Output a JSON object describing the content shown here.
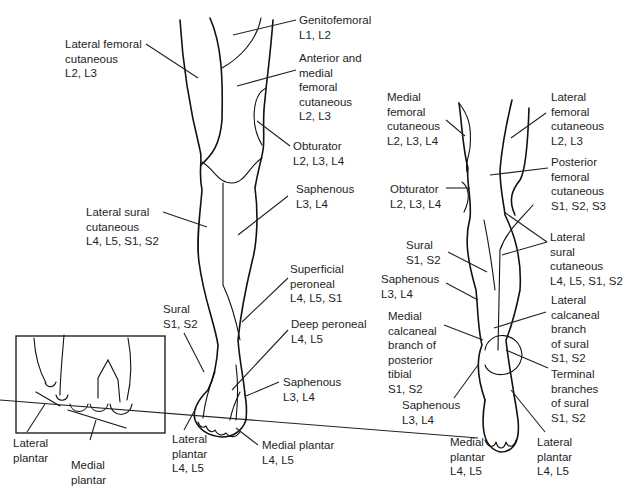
{
  "figure": {
    "panels": {
      "anterior": {
        "labels": [
          {
            "id": "genitofemoral",
            "name": "Genitofemoral",
            "roots": "L1, L2"
          },
          {
            "id": "lateral-femoral-cutaneous",
            "name": "Lateral femoral\ncutaneous",
            "roots": "L2, L3"
          },
          {
            "id": "anterior-medial-femoral-cutaneous",
            "name": "Anterior and\nmedial\nfemoral\ncutaneous",
            "roots": "L2, L3"
          },
          {
            "id": "obturator",
            "name": "Obturator",
            "roots": "L2, L3, L4"
          },
          {
            "id": "saphenous-leg",
            "name": "Saphenous",
            "roots": "L3, L4"
          },
          {
            "id": "lateral-sural-cutaneous",
            "name": "Lateral sural\ncutaneous",
            "roots": "L4, L5, S1, S2"
          },
          {
            "id": "superficial-peroneal",
            "name": "Superficial\nperoneal",
            "roots": "L4, L5, S1"
          },
          {
            "id": "sural",
            "name": "Sural",
            "roots": "S1, S2"
          },
          {
            "id": "deep-peroneal",
            "name": "Deep peroneal",
            "roots": "L4, L5"
          },
          {
            "id": "saphenous-foot",
            "name": "Saphenous",
            "roots": "L3, L4"
          },
          {
            "id": "lateral-plantar",
            "name": "Lateral\nplantar",
            "roots": "L4, L5"
          },
          {
            "id": "medial-plantar",
            "name": "Medial plantar",
            "roots": "L4, L5"
          }
        ]
      },
      "inset_toes": {
        "labels": [
          {
            "id": "inset-lateral-plantar",
            "name": "Lateral\nplantar"
          },
          {
            "id": "inset-medial-plantar",
            "name": "Medial\nplantar"
          }
        ]
      },
      "posterior": {
        "labels": [
          {
            "id": "post-medial-femoral-cutaneous",
            "name": "Medial\nfemoral\ncutaneous",
            "roots": "L2, L3, L4"
          },
          {
            "id": "post-lateral-femoral-cutaneous",
            "name": "Lateral\nfemoral\ncutaneous",
            "roots": "L2, L3"
          },
          {
            "id": "post-posterior-femoral-cutaneous",
            "name": "Posterior\nfemoral\ncutaneous",
            "roots": "S1, S2, S3"
          },
          {
            "id": "post-obturator",
            "name": "Obturator",
            "roots": "L2, L3, L4"
          },
          {
            "id": "post-sural",
            "name": "Sural",
            "roots": "S1, S2"
          },
          {
            "id": "post-lateral-sural-cutaneous",
            "name": "Lateral\nsural\ncutaneous",
            "roots": "L4, L5, S1, S2"
          },
          {
            "id": "post-saphenous-leg",
            "name": "Saphenous",
            "roots": "L3, L4"
          },
          {
            "id": "post-lateral-calcaneal",
            "name": "Lateral\ncalcaneal\nbranch\nof sural",
            "roots": "S1, S2"
          },
          {
            "id": "post-medial-calcaneal",
            "name": "Medial\ncalcaneal\nbranch of\nposterior\ntibial",
            "roots": "S1, S2"
          },
          {
            "id": "post-terminal-sural",
            "name": "Terminal\nbranches\nof sural",
            "roots": "S1, S2"
          },
          {
            "id": "post-saphenous-foot",
            "name": "Saphenous",
            "roots": "L3, L4"
          },
          {
            "id": "post-medial-plantar",
            "name": "Medial\nplantar",
            "roots": "L4, L5"
          },
          {
            "id": "post-lateral-plantar",
            "name": "Lateral\nplantar",
            "roots": "L4, L5"
          }
        ]
      }
    }
  }
}
